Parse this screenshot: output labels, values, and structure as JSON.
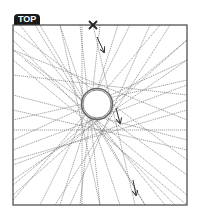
{
  "label": {
    "text": "TOP"
  },
  "frame": {
    "x": 13,
    "y": 25,
    "w": 174,
    "h": 180,
    "stroke": "#444444"
  },
  "marker": {
    "type": "x-mark",
    "x": 93,
    "y": 25
  },
  "circle": {
    "cx": 97,
    "cy": 104,
    "r": 14
  },
  "arrows": [
    {
      "x1": 97,
      "y1": 37,
      "x2": 104,
      "y2": 52
    },
    {
      "x1": 116,
      "y1": 108,
      "x2": 120,
      "y2": 123
    },
    {
      "x1": 133,
      "y1": 180,
      "x2": 136,
      "y2": 195
    }
  ],
  "rays": [
    [
      13,
      30,
      187,
      160
    ],
    [
      13,
      50,
      187,
      120
    ],
    [
      13,
      75,
      187,
      95
    ],
    [
      13,
      95,
      187,
      140
    ],
    [
      13,
      120,
      187,
      80
    ],
    [
      13,
      140,
      187,
      60
    ],
    [
      13,
      165,
      187,
      100
    ],
    [
      13,
      185,
      187,
      40
    ],
    [
      13,
      200,
      160,
      25
    ],
    [
      40,
      205,
      130,
      25
    ],
    [
      60,
      205,
      118,
      25
    ],
    [
      80,
      205,
      100,
      25
    ],
    [
      100,
      205,
      80,
      25
    ],
    [
      120,
      205,
      60,
      25
    ],
    [
      145,
      205,
      40,
      25
    ],
    [
      165,
      205,
      20,
      25
    ],
    [
      187,
      195,
      25,
      60
    ],
    [
      187,
      175,
      13,
      50
    ],
    [
      187,
      150,
      13,
      110
    ],
    [
      187,
      130,
      13,
      130
    ],
    [
      187,
      110,
      13,
      160
    ],
    [
      187,
      85,
      13,
      150
    ],
    [
      187,
      60,
      13,
      180
    ],
    [
      187,
      40,
      13,
      195
    ],
    [
      170,
      25,
      55,
      205
    ],
    [
      150,
      25,
      70,
      205
    ],
    [
      93,
      25,
      135,
      205
    ],
    [
      82,
      25,
      82,
      205
    ],
    [
      60,
      25,
      100,
      205
    ],
    [
      35,
      25,
      145,
      205
    ],
    [
      13,
      40,
      175,
      205
    ],
    [
      13,
      60,
      187,
      205
    ]
  ]
}
